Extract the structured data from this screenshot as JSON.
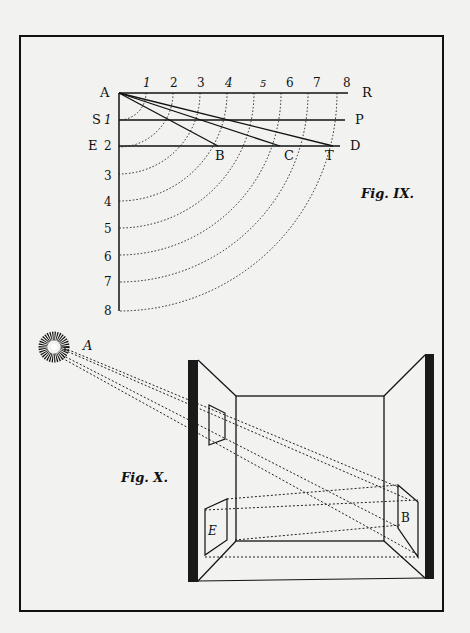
{
  "plate": {
    "background": "#f2f2f0",
    "ink": "#111111",
    "frame": {
      "x": 20,
      "y": 36,
      "width": 423,
      "height": 575
    }
  },
  "fig9": {
    "caption": "Fig. IX.",
    "top_numbers": [
      "1",
      "2",
      "3",
      "4",
      "5",
      "6",
      "7",
      "8"
    ],
    "left_numbers": [
      "1",
      "2",
      "3",
      "4",
      "5",
      "6",
      "7",
      "8"
    ],
    "labels": {
      "A": "A",
      "R": "R",
      "S": "S",
      "P": "P",
      "E": "E",
      "D": "D",
      "B": "B",
      "C": "C",
      "T": "T"
    }
  },
  "fig10": {
    "caption": "Fig. X.",
    "labels": {
      "A": "A",
      "E": "E",
      "B": "B"
    }
  }
}
